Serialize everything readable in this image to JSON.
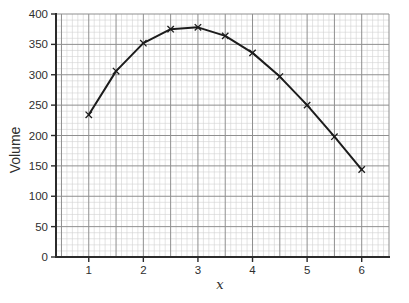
{
  "chart_data": {
    "type": "line",
    "title": "",
    "xlabel": "x",
    "ylabel": "Volume",
    "x": [
      1,
      1.5,
      2,
      2.5,
      3,
      3.5,
      4,
      4.5,
      5,
      5.5,
      6
    ],
    "values": [
      234,
      306,
      352,
      375,
      378,
      364,
      336,
      297,
      250,
      198,
      144
    ],
    "series_name": "Volume",
    "xlim": [
      0.4,
      6.5
    ],
    "ylim": [
      0,
      400
    ],
    "x_ticks": [
      1,
      2,
      3,
      4,
      5,
      6
    ],
    "y_ticks": [
      0,
      50,
      100,
      150,
      200,
      250,
      300,
      350,
      400
    ],
    "grid": {
      "visible": true,
      "x_minor_step": 0.1,
      "x_major_step": 0.5,
      "y_minor_step": 10,
      "y_major_step": 50
    },
    "marker": "x",
    "legend": "none",
    "colors": {
      "line": "#1c1c1c",
      "marker": "#1c1c1c",
      "axis": "#2b2b2b",
      "major_grid": "#8f8f8f",
      "minor_grid": "#d2d2d2",
      "text": "#2e2e2e",
      "background": "#ffffff"
    }
  }
}
